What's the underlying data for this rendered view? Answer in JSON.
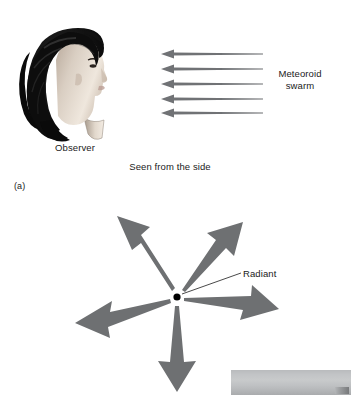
{
  "figure": {
    "panel_label": "(a)",
    "caption": "Seen from the side",
    "observer_label": "Observer",
    "swarm_label": "Meteoroid\nswarm",
    "radiant_label": "Radiant",
    "colors": {
      "arrow_gray": "#6e7072",
      "background": "#ffffff",
      "text": "#1a1a1a",
      "radiant_dot": "#000000",
      "hair_dark": "#121212",
      "skin": "#d8cfc4"
    }
  },
  "panel_a": {
    "description": "Observer head in profile with parallel meteoroid arrows seen from the side",
    "arrow_count": 5,
    "arrow_direction": "right-to-left",
    "arrows": [
      {
        "head_x": 162,
        "tail_x": 262,
        "y": 54
      },
      {
        "head_x": 162,
        "tail_x": 262,
        "y": 69
      },
      {
        "head_x": 162,
        "tail_x": 262,
        "y": 84
      },
      {
        "head_x": 162,
        "tail_x": 262,
        "y": 99
      },
      {
        "head_x": 162,
        "tail_x": 262,
        "y": 113
      }
    ]
  },
  "panel_b": {
    "description": "Meteors appearing to diverge from a radiant point",
    "radiant_point": {
      "x": 177,
      "y": 297
    },
    "arrow_count": 5,
    "arrow_bearings_deg": [
      318,
      42,
      250,
      110,
      182
    ]
  }
}
